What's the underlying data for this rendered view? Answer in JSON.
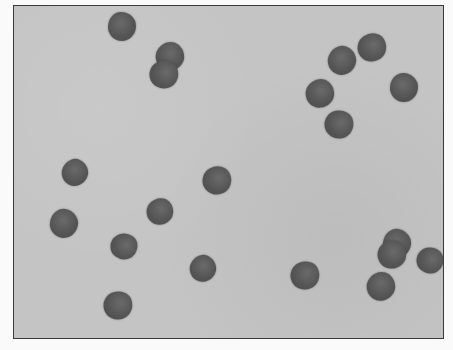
{
  "image": {
    "description": "Grayscale micrograph of dark rounded cells on a light gray field inside a thin dark frame",
    "colors": {
      "background": "#fafafa",
      "field": "#c4c4c4",
      "frame": "#3a3a3a",
      "cell": "#555555"
    },
    "frame": {
      "x": 13,
      "y": 5,
      "width": 431,
      "height": 334
    },
    "cells": [
      {
        "x": 122,
        "y": 26,
        "r": 14
      },
      {
        "x": 170,
        "y": 56,
        "r": 14
      },
      {
        "x": 164,
        "y": 74,
        "r": 14
      },
      {
        "x": 342,
        "y": 60,
        "r": 14
      },
      {
        "x": 372,
        "y": 47,
        "r": 14
      },
      {
        "x": 404,
        "y": 87,
        "r": 14
      },
      {
        "x": 320,
        "y": 93,
        "r": 14
      },
      {
        "x": 339,
        "y": 124,
        "r": 14
      },
      {
        "x": 75,
        "y": 172,
        "r": 13
      },
      {
        "x": 217,
        "y": 180,
        "r": 14
      },
      {
        "x": 64,
        "y": 223,
        "r": 14
      },
      {
        "x": 160,
        "y": 211,
        "r": 13
      },
      {
        "x": 124,
        "y": 246,
        "r": 13
      },
      {
        "x": 203,
        "y": 268,
        "r": 13
      },
      {
        "x": 305,
        "y": 275,
        "r": 14
      },
      {
        "x": 397,
        "y": 243,
        "r": 14
      },
      {
        "x": 392,
        "y": 254,
        "r": 14
      },
      {
        "x": 430,
        "y": 260,
        "r": 13
      },
      {
        "x": 381,
        "y": 286,
        "r": 14
      },
      {
        "x": 118,
        "y": 305,
        "r": 14
      }
    ]
  }
}
